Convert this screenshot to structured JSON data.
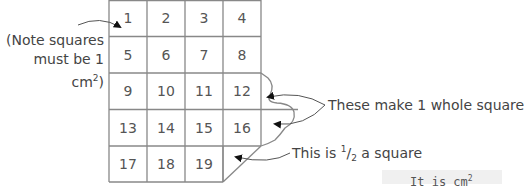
{
  "diagram": {
    "note": {
      "line1": "(Note squares",
      "line2_prefix": "must be 1 cm",
      "line2_sup": "2",
      "line2_suffix": ")"
    },
    "grid": {
      "rows": 5,
      "cols": 4,
      "cells": [
        "1",
        "2",
        "3",
        "4",
        "5",
        "6",
        "7",
        "8",
        "9",
        "10",
        "11",
        "12",
        "13",
        "14",
        "15",
        "16",
        "17",
        "18",
        "19"
      ]
    },
    "labels": {
      "whole_square": "These make 1 whole square",
      "half_prefix": "This is ",
      "half_num": "1",
      "half_den": "2",
      "half_suffix": " a square"
    },
    "bottom_text": {
      "prefix": "It is ",
      "unit": "cm",
      "sup": "2"
    },
    "colors": {
      "line": "#888888",
      "text": "#444444",
      "arrow": "#111111"
    }
  }
}
